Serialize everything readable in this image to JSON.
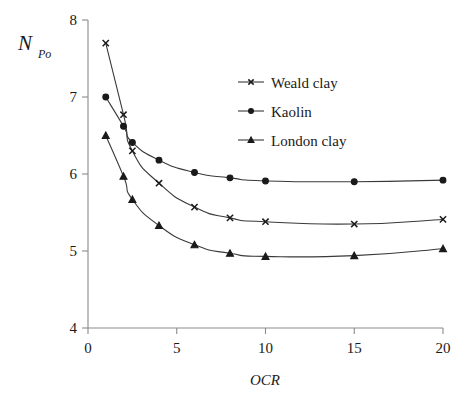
{
  "figure": {
    "background_color": "#ffffff",
    "axis_color": "#8a8a8a",
    "ink_color": "#1a1a1a"
  },
  "y_axis_label": {
    "main": "N",
    "sub": "Po"
  },
  "chart_data": {
    "type": "line",
    "title": "",
    "xlabel": "OCR",
    "ylabel": "N_Po",
    "xlim": [
      0,
      20
    ],
    "ylim": [
      4,
      8
    ],
    "xticks": [
      "0",
      "5",
      "10",
      "15",
      "20"
    ],
    "xtick_values": [
      0,
      5,
      10,
      15,
      20
    ],
    "yticks": [
      "4",
      "5",
      "6",
      "7",
      "8"
    ],
    "ytick_values": [
      4,
      5,
      6,
      7,
      8
    ],
    "grid": false,
    "legend_position": "upper-center-right",
    "x": [
      1,
      2,
      2.5,
      4,
      6,
      8,
      10,
      15,
      20
    ],
    "series": [
      {
        "name": "Weald clay",
        "marker": "x",
        "values": [
          7.7,
          6.77,
          6.3,
          5.88,
          5.57,
          5.43,
          5.38,
          5.35,
          5.41
        ]
      },
      {
        "name": "Kaolin",
        "marker": "circle",
        "values": [
          7.0,
          6.62,
          6.41,
          6.18,
          6.02,
          5.95,
          5.91,
          5.9,
          5.92
        ]
      },
      {
        "name": "London clay",
        "marker": "triangle",
        "values": [
          6.5,
          5.97,
          5.67,
          5.33,
          5.08,
          4.97,
          4.93,
          4.94,
          5.03
        ]
      }
    ]
  },
  "legend": {
    "items": [
      {
        "label": "Weald clay",
        "marker": "x"
      },
      {
        "label": "Kaolin",
        "marker": "circle"
      },
      {
        "label": "London clay",
        "marker": "triangle"
      }
    ]
  }
}
